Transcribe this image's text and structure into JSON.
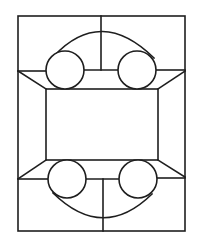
{
  "diagram": {
    "type": "line-drawing",
    "stroke_color": "#1e1e1e",
    "background_color": "#ffffff",
    "canvas": {
      "width": 201,
      "height": 248
    },
    "outer_rect": {
      "x": 18,
      "y": 16,
      "width": 167,
      "height": 215
    },
    "inner_rect": {
      "x": 46,
      "y": 89,
      "width": 112,
      "height": 71
    },
    "lines": [
      {
        "name": "top-center-vertical",
        "x1": 101,
        "y1": 16,
        "x2": 101,
        "y2": 70
      },
      {
        "name": "top-left-horizontal",
        "x1": 18,
        "y1": 71,
        "x2": 46,
        "y2": 71
      },
      {
        "name": "top-mid-horizontal",
        "x1": 84,
        "y1": 70,
        "x2": 118,
        "y2": 70
      },
      {
        "name": "top-right-horizontal",
        "x1": 156,
        "y1": 70,
        "x2": 185,
        "y2": 70
      },
      {
        "name": "top-left-diagonal",
        "x1": 18,
        "y1": 71,
        "x2": 46,
        "y2": 89
      },
      {
        "name": "top-right-diagonal",
        "x1": 185,
        "y1": 71,
        "x2": 158,
        "y2": 89
      },
      {
        "name": "bottom-left-diagonal",
        "x1": 18,
        "y1": 179,
        "x2": 46,
        "y2": 160
      },
      {
        "name": "bottom-right-diagonal",
        "x1": 185,
        "y1": 177,
        "x2": 158,
        "y2": 160
      },
      {
        "name": "bottom-left-horizontal",
        "x1": 18,
        "y1": 179,
        "x2": 48,
        "y2": 179
      },
      {
        "name": "bottom-mid-horizontal",
        "x1": 86,
        "y1": 179,
        "x2": 119,
        "y2": 179
      },
      {
        "name": "bottom-right-horizontal",
        "x1": 157,
        "y1": 178,
        "x2": 185,
        "y2": 178
      },
      {
        "name": "bottom-center-vertical",
        "x1": 103,
        "y1": 179,
        "x2": 103,
        "y2": 231
      }
    ],
    "circles": [
      {
        "name": "top-left-circle",
        "cx": 65,
        "cy": 70,
        "r": 19
      },
      {
        "name": "top-right-circle",
        "cx": 137,
        "cy": 70,
        "r": 19
      },
      {
        "name": "bottom-left-circle",
        "cx": 67,
        "cy": 179,
        "r": 19
      },
      {
        "name": "bottom-right-circle",
        "cx": 138,
        "cy": 179,
        "r": 19
      }
    ],
    "arcs": [
      {
        "name": "top-arc",
        "d": "M 54 56 Q 101 6 154 58"
      },
      {
        "name": "bottom-arc",
        "d": "M 53 193 Q 103 242 152 194"
      }
    ]
  }
}
